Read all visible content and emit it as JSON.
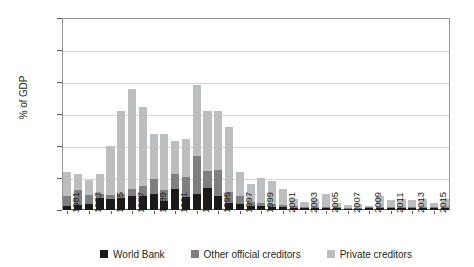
{
  "chart_data": {
    "type": "bar",
    "stacked": true,
    "title": "",
    "subtitle": "",
    "xlabel": "",
    "ylabel": "% of GDP",
    "ylim": [
      0.0,
      6.0
    ],
    "ytick_labels": [
      "0.0",
      "1.0",
      "2.0",
      "3.0",
      "4.0",
      "5.0",
      "6.0"
    ],
    "ytick_values": [
      0.0,
      1.0,
      2.0,
      3.0,
      4.0,
      5.0,
      6.0
    ],
    "grid": "horizontal",
    "legend_position": "bottom-center",
    "legend": [
      "World Bank",
      "Other official creditors",
      "Private creditors"
    ],
    "categories": [
      "1981",
      "1982",
      "1983",
      "1984",
      "1985",
      "1986",
      "1987",
      "1988",
      "1989",
      "1990",
      "1991",
      "1992",
      "1993",
      "1994",
      "1995",
      "1996",
      "1997",
      "1998",
      "1999",
      "2000",
      "2001",
      "2002",
      "2003",
      "2004",
      "2005",
      "2006",
      "2007",
      "2008",
      "2009",
      "2010",
      "2011",
      "2012",
      "2013",
      "2014",
      "2015",
      "2016"
    ],
    "xtick_labels": [
      "1981",
      "1983",
      "1985",
      "1987",
      "1989",
      "1991",
      "1993",
      "1995",
      "1997",
      "1999",
      "2001",
      "2003",
      "2005",
      "2007",
      "2009",
      "2011",
      "2013",
      "2015"
    ],
    "series": [
      {
        "name": "World Bank",
        "color": "#1a1a1a",
        "values": [
          0.12,
          0.16,
          0.19,
          0.36,
          0.35,
          0.37,
          0.45,
          0.45,
          0.5,
          0.27,
          0.67,
          0.42,
          0.51,
          0.69,
          0.43,
          0.23,
          0.2,
          0.13,
          0.11,
          0.1,
          0.09,
          0.07,
          0.06,
          0.06,
          0.06,
          0.05,
          0.04,
          0.04,
          0.05,
          0.06,
          0.06,
          0.06,
          0.06,
          0.06,
          0.05,
          0.05
        ]
      },
      {
        "name": "Other official creditors",
        "color": "#7d7f81",
        "values": [
          0.32,
          0.47,
          0.29,
          0.14,
          0.13,
          0.14,
          0.22,
          0.3,
          0.47,
          0.36,
          0.44,
          0.6,
          1.18,
          0.52,
          0.82,
          0.32,
          0.25,
          0.12,
          0.1,
          0.09,
          0.07,
          0.05,
          0.04,
          0.04,
          0.04,
          0.03,
          0.03,
          0.03,
          0.03,
          0.03,
          0.04,
          0.03,
          0.03,
          0.03,
          0.03,
          0.03
        ]
      },
      {
        "name": "Private creditors",
        "color": "#bcbec0",
        "values": [
          0.74,
          0.51,
          0.45,
          0.63,
          1.52,
          2.6,
          3.11,
          2.47,
          1.4,
          1.73,
          1.04,
          1.2,
          2.23,
          1.88,
          1.85,
          2.05,
          0.75,
          0.55,
          0.78,
          0.73,
          0.51,
          0.21,
          0.16,
          0.25,
          0.39,
          0.13,
          0.1,
          0.11,
          0.06,
          0.36,
          0.2,
          0.24,
          0.21,
          0.27,
          0.14,
          0.26
        ]
      }
    ],
    "totals": [
      1.18,
      1.14,
      0.93,
      1.13,
      2.0,
      3.11,
      3.78,
      3.22,
      2.37,
      2.36,
      2.15,
      2.22,
      3.92,
      3.09,
      3.1,
      2.6,
      1.2,
      0.8,
      0.99,
      0.92,
      0.67,
      0.33,
      0.26,
      0.35,
      0.49,
      0.21,
      0.17,
      0.18,
      0.14,
      0.45,
      0.3,
      0.33,
      0.3,
      0.36,
      0.22,
      0.34
    ]
  },
  "colors": {
    "world_bank": "#1a1a1a",
    "other_official": "#7d7f81",
    "private": "#bcbec0",
    "gridline": "#d7d8d9",
    "axis": "#58595b",
    "text": "#231f20",
    "background": "#ffffff"
  }
}
